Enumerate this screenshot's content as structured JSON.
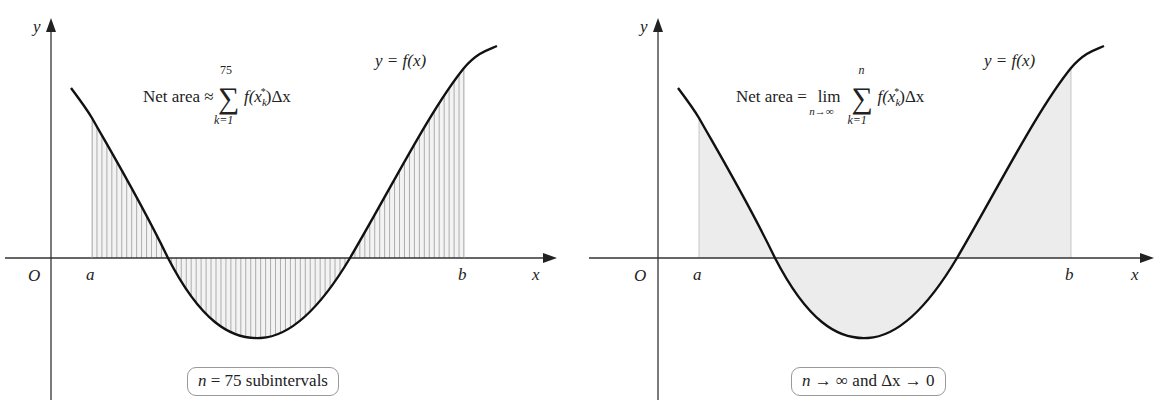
{
  "figure": {
    "panels": [
      {
        "id": "left",
        "formula": {
          "prefix": "Net area ≈",
          "sum_upper": "75",
          "sum_lower": "k=1",
          "body": "f(x",
          "sub_star": "k",
          "body_end": ")Δx"
        },
        "curve_label": "y = f(x)",
        "axis_labels": {
          "y": "y",
          "x": "x",
          "origin": "O",
          "a": "a",
          "b": "b"
        },
        "callout": {
          "var": "n",
          "text": " = 75 subintervals"
        },
        "shading": "75 vertical rectangles (Riemann sum)"
      },
      {
        "id": "right",
        "formula": {
          "prefix": "Net area =",
          "lim": "lim",
          "lim_sub": "n→∞",
          "sum_upper": "n",
          "sum_lower": "k=1",
          "body": "f(x",
          "sub_star": "k",
          "body_end": ")Δx"
        },
        "curve_label": "y = f(x)",
        "axis_labels": {
          "y": "y",
          "x": "x",
          "origin": "O",
          "a": "a",
          "b": "b"
        },
        "callout": {
          "var": "n",
          "text": " → ∞ and Δx → 0"
        },
        "shading": "solid gray (limit)"
      }
    ],
    "colors": {
      "curve": "#111111",
      "axis": "#333333",
      "hatch": "#9a9a9a",
      "fill": "#e8e8e8",
      "callout_border": "#999999"
    }
  }
}
